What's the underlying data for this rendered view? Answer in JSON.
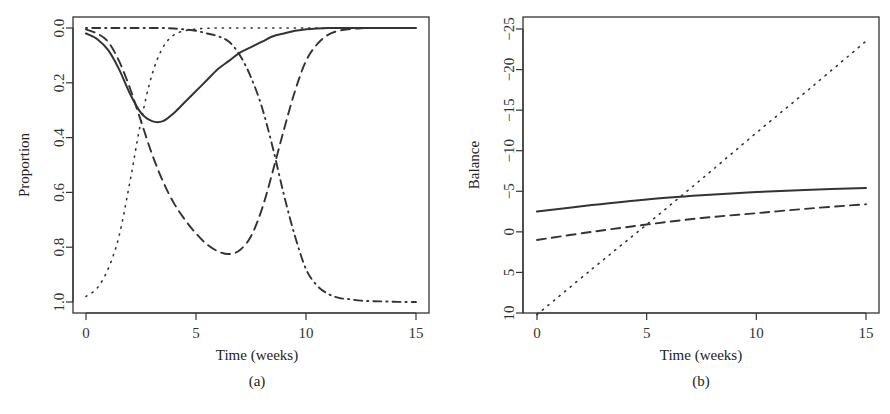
{
  "chart_data": [
    {
      "type": "line",
      "panel": "(a)",
      "xlabel": "Time (weeks)",
      "ylabel": "Proportion",
      "xlim": [
        0,
        15
      ],
      "ylim": [
        0,
        1
      ],
      "xticks": [
        "0",
        "5",
        "10",
        "15"
      ],
      "yticks": [
        "0.0",
        "0.2",
        "0.4",
        "0.6",
        "0.8",
        "1.0"
      ],
      "grid": false,
      "legend": "none",
      "x": [
        0,
        0.5,
        1,
        1.5,
        2,
        2.5,
        3,
        3.5,
        4,
        4.5,
        5,
        5.5,
        6,
        6.5,
        7,
        7.5,
        8,
        8.5,
        9,
        9.5,
        10,
        10.5,
        11,
        11.5,
        12,
        12.5,
        13,
        13.5,
        14,
        14.5,
        15
      ],
      "series": [
        {
          "name": "solid",
          "style": "solid",
          "values": [
            0.02,
            0.04,
            0.08,
            0.15,
            0.24,
            0.31,
            0.34,
            0.34,
            0.31,
            0.27,
            0.23,
            0.19,
            0.15,
            0.12,
            0.09,
            0.07,
            0.05,
            0.03,
            0.02,
            0.01,
            0.005,
            0.002,
            0,
            0,
            0,
            0,
            0,
            0,
            0,
            0,
            0
          ]
        },
        {
          "name": "dashed",
          "style": "dashed",
          "values": [
            0.005,
            0.02,
            0.05,
            0.12,
            0.22,
            0.34,
            0.46,
            0.56,
            0.64,
            0.7,
            0.75,
            0.79,
            0.815,
            0.825,
            0.81,
            0.76,
            0.66,
            0.52,
            0.37,
            0.23,
            0.12,
            0.06,
            0.025,
            0.01,
            0.004,
            0.001,
            0,
            0,
            0,
            0,
            0
          ]
        },
        {
          "name": "dotted",
          "style": "dotted",
          "values": [
            0.98,
            0.95,
            0.88,
            0.76,
            0.56,
            0.34,
            0.17,
            0.07,
            0.025,
            0.01,
            0.004,
            0.001,
            0,
            0,
            0,
            0,
            0,
            0,
            0,
            0,
            0,
            0,
            0,
            0,
            0,
            0,
            0,
            0,
            0,
            0,
            0
          ]
        },
        {
          "name": "dot-dash",
          "style": "dotdash",
          "values": [
            0,
            0,
            0,
            0,
            0,
            0,
            0,
            0,
            0.002,
            0.005,
            0.01,
            0.02,
            0.03,
            0.05,
            0.1,
            0.18,
            0.29,
            0.44,
            0.61,
            0.76,
            0.88,
            0.94,
            0.97,
            0.985,
            0.99,
            0.995,
            0.997,
            0.998,
            0.999,
            1.0,
            1.0
          ]
        }
      ]
    },
    {
      "type": "line",
      "panel": "(b)",
      "xlabel": "Time (weeks)",
      "ylabel": "Balance",
      "xlim": [
        0,
        15
      ],
      "ylim": [
        -25,
        10
      ],
      "xticks": [
        "0",
        "5",
        "10",
        "15"
      ],
      "yticks": [
        "-25",
        "-20",
        "-15",
        "-10",
        "-5",
        "0",
        "5",
        "10"
      ],
      "grid": false,
      "legend": "none",
      "x": [
        0,
        2.5,
        5,
        7.5,
        10,
        12.5,
        15
      ],
      "series": [
        {
          "name": "solid",
          "style": "solid",
          "values": [
            -2.5,
            -3.3,
            -4.0,
            -4.5,
            -4.9,
            -5.2,
            -5.4
          ]
        },
        {
          "name": "dashed",
          "style": "dashed",
          "values": [
            1.0,
            0.0,
            -0.9,
            -1.7,
            -2.3,
            -2.9,
            -3.4
          ]
        },
        {
          "name": "dotted",
          "style": "dotted",
          "values": [
            10.2,
            4.6,
            -0.9,
            -6.5,
            -12.2,
            -17.8,
            -23.5
          ]
        }
      ]
    }
  ],
  "panels": {
    "a": {
      "caption": "(a)",
      "xlabel": "Time (weeks)",
      "ylabel": "Proportion"
    },
    "b": {
      "caption": "(b)",
      "xlabel": "Time (weeks)",
      "ylabel": "Balance"
    }
  }
}
